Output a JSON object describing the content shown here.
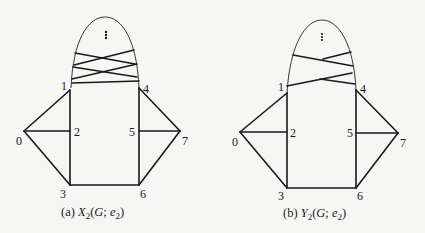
{
  "figures": [
    {
      "id": "a",
      "caption_prefix": "(a) ",
      "caption_func": "X",
      "caption_sub": "2",
      "caption_args_open": "(",
      "caption_G": "G",
      "caption_sep": "; ",
      "caption_e": "e",
      "caption_e_sub": "2",
      "caption_args_close": ")",
      "vertex_labels": [
        "0",
        "1",
        "2",
        "3",
        "4",
        "5",
        "6",
        "7"
      ],
      "ellipsis": "⋮"
    },
    {
      "id": "b",
      "caption_prefix": "(b) ",
      "caption_func": "Y",
      "caption_sub": "2",
      "caption_args_open": "(",
      "caption_G": "G",
      "caption_sep": "; ",
      "caption_e": "e",
      "caption_e_sub": "2",
      "caption_args_close": ")",
      "vertex_labels": [
        "0",
        "1",
        "2",
        "3",
        "4",
        "5",
        "6",
        "7"
      ],
      "ellipsis": "⋮"
    }
  ],
  "colors": {
    "line": "#1a1a1a",
    "background": "#f6f6f4"
  }
}
